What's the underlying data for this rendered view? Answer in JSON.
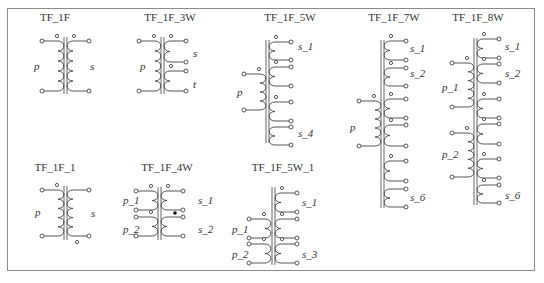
{
  "panel": {
    "frame_color": "#8a8a8a",
    "line_color": "#444444"
  },
  "symbols": [
    {
      "id": "TF_1F",
      "title": "TF_1F",
      "title_x": 55,
      "title_y": 21,
      "core_x": [
        64,
        67
      ],
      "core_y": [
        37,
        94
      ],
      "primaries": [
        {
          "label": "p",
          "x": 58,
          "y1": 41,
          "y2": 91,
          "turns": 5,
          "label_x": 34,
          "label_y": 70,
          "tag_dot": true
        }
      ],
      "secondaries": [
        {
          "label": "s",
          "x": 73,
          "y1": 41,
          "y2": 91,
          "turns": 5,
          "label_x": 90,
          "label_y": 70,
          "tag_dot": true
        }
      ],
      "dots": []
    },
    {
      "id": "TF_1F_3W",
      "title": "TF_1F_3W",
      "title_x": 170,
      "title_y": 21,
      "core_x": [
        161,
        164
      ],
      "core_y": [
        37,
        94
      ],
      "primaries": [
        {
          "label": "p",
          "x": 155,
          "y1": 41,
          "y2": 91,
          "turns": 5,
          "label_x": 140,
          "label_y": 70,
          "tag_dot": true
        }
      ],
      "secondaries": [
        {
          "label": "s",
          "x": 170,
          "y1": 41,
          "y2": 62,
          "turns": 2,
          "label_x": 193,
          "label_y": 57,
          "tag_dot": true
        },
        {
          "label": "t",
          "x": 170,
          "y1": 71,
          "y2": 91,
          "turns": 2,
          "label_x": 193,
          "label_y": 88,
          "tag_dot": true
        }
      ],
      "dots": []
    },
    {
      "id": "TF_1F_5W",
      "title": "TF_1F_5W",
      "title_x": 290,
      "title_y": 21,
      "core_x": [
        266,
        269
      ],
      "core_y": [
        40,
        143
      ],
      "primaries": [
        {
          "label": "p",
          "x": 260,
          "y1": 74,
          "y2": 110,
          "turns": 4,
          "label_x": 237,
          "label_y": 96,
          "tag_dot": true
        }
      ],
      "secondaries": [
        {
          "label": "s_1",
          "x": 275,
          "y1": 42,
          "y2": 60,
          "turns": 2,
          "label_x": 298,
          "label_y": 50,
          "tag_dot": true
        },
        {
          "label": "",
          "x": 275,
          "y1": 67,
          "y2": 86,
          "turns": 2,
          "label_x": 0,
          "label_y": 0,
          "tag_dot": true
        },
        {
          "label": "",
          "x": 275,
          "y1": 102,
          "y2": 121,
          "turns": 2,
          "label_x": 0,
          "label_y": 0,
          "tag_dot": true
        },
        {
          "label": "s_4",
          "x": 275,
          "y1": 127,
          "y2": 145,
          "turns": 2,
          "label_x": 298,
          "label_y": 137,
          "tag_dot": false
        }
      ],
      "dots": []
    },
    {
      "id": "TF_1F_7W",
      "title": "TF_1F_7W",
      "title_x": 394,
      "title_y": 21,
      "core_x": [
        381,
        384
      ],
      "core_y": [
        40,
        208
      ],
      "primaries": [
        {
          "label": "p",
          "x": 375,
          "y1": 101,
          "y2": 146,
          "turns": 5,
          "label_x": 350,
          "label_y": 131,
          "tag_dot": true
        }
      ],
      "secondaries": [
        {
          "label": "s_1",
          "x": 390,
          "y1": 41,
          "y2": 60,
          "turns": 2,
          "label_x": 410,
          "label_y": 52,
          "tag_dot": true
        },
        {
          "label": "s_2",
          "x": 390,
          "y1": 68,
          "y2": 86,
          "turns": 2,
          "label_x": 410,
          "label_y": 77,
          "tag_dot": true
        },
        {
          "label": "",
          "x": 390,
          "y1": 99,
          "y2": 118,
          "turns": 2,
          "label_x": 0,
          "label_y": 0,
          "tag_dot": true
        },
        {
          "label": "",
          "x": 390,
          "y1": 125,
          "y2": 146,
          "turns": 2,
          "label_x": 0,
          "label_y": 0,
          "tag_dot": true
        },
        {
          "label": "",
          "x": 390,
          "y1": 161,
          "y2": 181,
          "turns": 2,
          "label_x": 0,
          "label_y": 0,
          "tag_dot": true
        },
        {
          "label": "s_6",
          "x": 390,
          "y1": 189,
          "y2": 207,
          "turns": 2,
          "label_x": 410,
          "label_y": 201,
          "tag_dot": false
        }
      ],
      "dots": []
    },
    {
      "id": "TF_1F_8W",
      "title": "TF_1F_8W",
      "title_x": 478,
      "title_y": 21,
      "core_x": [
        474,
        477
      ],
      "core_y": [
        38,
        205
      ],
      "primaries": [
        {
          "label": "p_1",
          "x": 468,
          "y1": 63,
          "y2": 107,
          "turns": 5,
          "label_x": 442,
          "label_y": 91,
          "tag_dot": true
        },
        {
          "label": "p_2",
          "x": 468,
          "y1": 133,
          "y2": 177,
          "turns": 5,
          "label_x": 442,
          "label_y": 158,
          "tag_dot": true
        }
      ],
      "secondaries": [
        {
          "label": "s_1",
          "x": 483,
          "y1": 39,
          "y2": 58,
          "turns": 2,
          "label_x": 505,
          "label_y": 50,
          "tag_dot": true
        },
        {
          "label": "s_2",
          "x": 483,
          "y1": 64,
          "y2": 83,
          "turns": 2,
          "label_x": 505,
          "label_y": 77,
          "tag_dot": true
        },
        {
          "label": "",
          "x": 483,
          "y1": 99,
          "y2": 118,
          "turns": 2,
          "label_x": 0,
          "label_y": 0,
          "tag_dot": true
        },
        {
          "label": "",
          "x": 483,
          "y1": 124,
          "y2": 144,
          "turns": 2,
          "label_x": 0,
          "label_y": 0,
          "tag_dot": true
        },
        {
          "label": "",
          "x": 483,
          "y1": 159,
          "y2": 178,
          "turns": 2,
          "label_x": 0,
          "label_y": 0,
          "tag_dot": true
        },
        {
          "label": "s_6",
          "x": 483,
          "y1": 185,
          "y2": 203,
          "turns": 2,
          "label_x": 505,
          "label_y": 199,
          "tag_dot": true
        }
      ],
      "dots": []
    },
    {
      "id": "TF_1F_1",
      "title": "TF_1F_1",
      "title_x": 55,
      "title_y": 171,
      "core_x": [
        64,
        67
      ],
      "core_y": [
        186,
        240
      ],
      "primaries": [
        {
          "label": "p",
          "x": 58,
          "y1": 190,
          "y2": 236,
          "turns": 5,
          "label_x": 35,
          "label_y": 216,
          "tag_dot": true
        }
      ],
      "secondaries": [
        {
          "label": "s",
          "x": 73,
          "y1": 190,
          "y2": 236,
          "turns": 5,
          "label_x": 91,
          "label_y": 217,
          "tag_dot": false
        }
      ],
      "bottom_tag": {
        "x": 77,
        "y": 242
      },
      "dots": []
    },
    {
      "id": "TF_1F_4W",
      "title": "TF_1F_4W",
      "title_x": 167,
      "title_y": 171,
      "core_x": [
        158,
        161
      ],
      "core_y": [
        187,
        240
      ],
      "primaries": [
        {
          "label": "p_1",
          "x": 152,
          "y1": 191,
          "y2": 210,
          "turns": 2,
          "label_x": 123,
          "label_y": 204,
          "tag_dot": true
        },
        {
          "label": "p_2",
          "x": 152,
          "y1": 217,
          "y2": 236,
          "turns": 2,
          "label_x": 123,
          "label_y": 233,
          "tag_dot": true
        }
      ],
      "secondaries": [
        {
          "label": "s_1",
          "x": 167,
          "y1": 191,
          "y2": 210,
          "turns": 2,
          "label_x": 198,
          "label_y": 204,
          "tag_dot": true
        },
        {
          "label": "s_2",
          "x": 167,
          "y1": 217,
          "y2": 236,
          "turns": 2,
          "label_x": 198,
          "label_y": 233,
          "tag_dot": false
        }
      ],
      "dots": [
        {
          "x": 175,
          "y": 213
        }
      ]
    },
    {
      "id": "TF_1F_5W_1",
      "title": "TF_1F_5W_1",
      "title_x": 283,
      "title_y": 171,
      "core_x": [
        272,
        275
      ],
      "core_y": [
        187,
        265
      ],
      "primaries": [
        {
          "label": "p_1",
          "x": 265,
          "y1": 219,
          "y2": 238,
          "turns": 2,
          "label_x": 232,
          "label_y": 233,
          "tag_dot": true
        },
        {
          "label": "p_2",
          "x": 265,
          "y1": 244,
          "y2": 263,
          "turns": 2,
          "label_x": 232,
          "label_y": 258,
          "tag_dot": true
        }
      ],
      "secondaries": [
        {
          "label": "s_1",
          "x": 281,
          "y1": 193,
          "y2": 212,
          "turns": 2,
          "label_x": 302,
          "label_y": 206,
          "tag_dot": true
        },
        {
          "label": "",
          "x": 281,
          "y1": 219,
          "y2": 238,
          "turns": 2,
          "label_x": 0,
          "label_y": 0,
          "tag_dot": true
        },
        {
          "label": "s_3",
          "x": 281,
          "y1": 244,
          "y2": 263,
          "turns": 2,
          "label_x": 302,
          "label_y": 258,
          "tag_dot": true
        }
      ],
      "dots": []
    }
  ]
}
